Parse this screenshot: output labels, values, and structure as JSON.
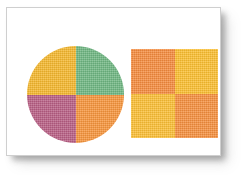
{
  "figure": {
    "background_color": "#ffffff",
    "card": {
      "background_color": "#ffffff",
      "border_color": "#cfcfcf",
      "shadow_color": "#464646"
    },
    "shapes": [
      {
        "name": "quadrant-circle",
        "shape": "circle",
        "segments": [
          {
            "position": "top-left",
            "color": "#f5b72c",
            "color_name": "amber-yellow"
          },
          {
            "position": "top-right",
            "color": "#6eb681",
            "color_name": "green"
          },
          {
            "position": "bottom-left",
            "color": "#b85d83",
            "color_name": "magenta-purple"
          },
          {
            "position": "bottom-right",
            "color": "#f7943a",
            "color_name": "orange"
          }
        ]
      },
      {
        "name": "checkerboard-square",
        "shape": "square",
        "segments": [
          {
            "position": "top-left",
            "color": "#f58a3c",
            "color_name": "orange"
          },
          {
            "position": "top-right",
            "color": "#fbbe2e",
            "color_name": "amber-yellow"
          },
          {
            "position": "bottom-left",
            "color": "#fbbe33",
            "color_name": "amber-yellow"
          },
          {
            "position": "bottom-right",
            "color": "#f58e3c",
            "color_name": "orange"
          }
        ]
      }
    ]
  }
}
